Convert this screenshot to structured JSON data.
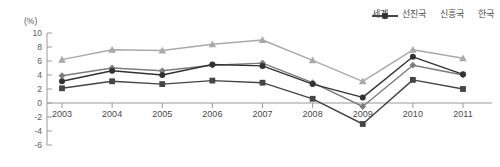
{
  "chart_data": {
    "type": "line",
    "title": "",
    "xlabel": "",
    "ylabel": "(%)",
    "unit_label": "(%)",
    "categories": [
      "2003",
      "2004",
      "2005",
      "2006",
      "2007",
      "2008",
      "2009",
      "2010",
      "2011"
    ],
    "ylim": [
      -6,
      10
    ],
    "ytick_labels": [
      "10",
      "8",
      "6",
      "4",
      "2",
      "0",
      "-2",
      "-4",
      "-6"
    ],
    "ytick_values": [
      10,
      8,
      6,
      4,
      2,
      0,
      -2,
      -4,
      -6
    ],
    "grid": false,
    "legend_position": "top-right",
    "series": [
      {
        "name": "세계",
        "marker": "diamond",
        "color": "#7d7d7d",
        "values": [
          3.9,
          5.0,
          4.6,
          5.4,
          5.7,
          2.9,
          -0.5,
          5.4,
          4.0
        ]
      },
      {
        "name": "선진국",
        "marker": "square",
        "color": "#454545",
        "values": [
          2.1,
          3.1,
          2.7,
          3.2,
          2.9,
          0.6,
          -3.0,
          3.3,
          2.0
        ]
      },
      {
        "name": "신흥국",
        "marker": "triangle",
        "color": "#a9a9a9",
        "values": [
          6.2,
          7.6,
          7.5,
          8.4,
          9.0,
          6.1,
          3.1,
          7.6,
          6.4
        ]
      },
      {
        "name": "한국",
        "marker": "circle",
        "color": "#333333",
        "values": [
          3.1,
          4.6,
          4.0,
          5.5,
          5.3,
          2.7,
          0.8,
          6.6,
          4.1
        ]
      }
    ]
  },
  "legend": {
    "items": [
      {
        "label": "세계",
        "marker": "diamond",
        "color": "#7d7d7d"
      },
      {
        "label": "선진국",
        "marker": "square",
        "color": "#454545"
      },
      {
        "label": "신흥국",
        "marker": "triangle",
        "color": "#a9a9a9"
      },
      {
        "label": "한국",
        "marker": "circle",
        "color": "#333333"
      }
    ]
  },
  "axes": {
    "unit": "(%)",
    "y_labels": [
      "10",
      "8",
      "6",
      "4",
      "2",
      "0",
      "-2",
      "-4",
      "-6"
    ],
    "x_labels": [
      "2003",
      "2004",
      "2005",
      "2006",
      "2007",
      "2008",
      "2009",
      "2010",
      "2011"
    ]
  }
}
